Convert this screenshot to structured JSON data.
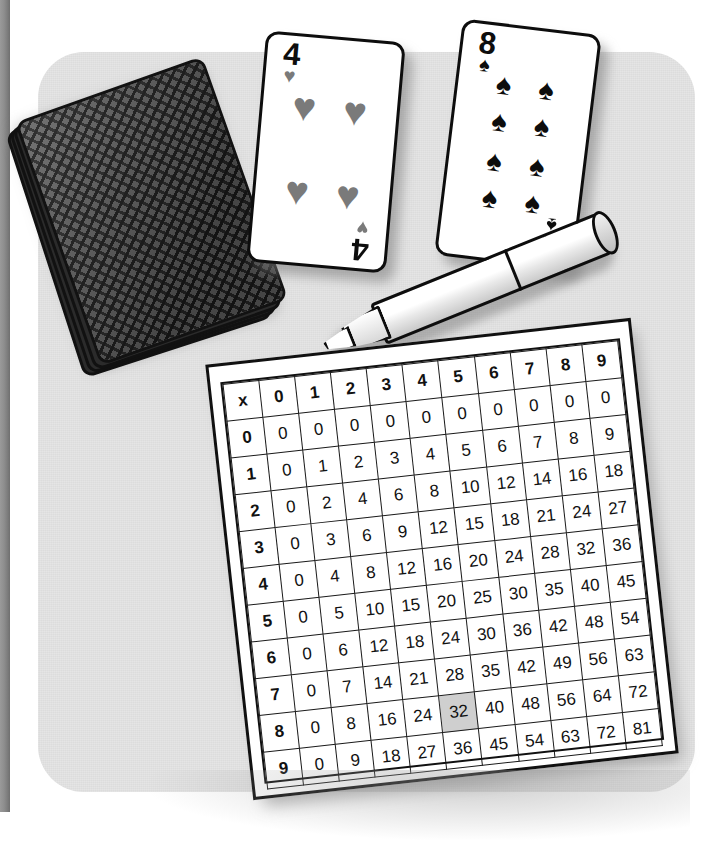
{
  "scene": {
    "title": "Multiplication table worksheet with playing cards and marker",
    "surface_color": "#dcdcdc",
    "floor_color": "#ffffff",
    "edge_bar_color": "#8e8e8e"
  },
  "deck": {
    "label": "Face-down deck of playing cards",
    "back_pattern": "diamond-chevron",
    "back_color": "#5b5b5b",
    "border_color": "#121212"
  },
  "cards": [
    {
      "name": "four-of-hearts",
      "rank": "4",
      "suit_glyph": "♥",
      "suit_name": "hearts",
      "pip_count": 4,
      "color": "#7a7a7a",
      "pips": [
        {
          "x": 31,
          "y": 31
        },
        {
          "x": 69,
          "y": 31
        },
        {
          "x": 31,
          "y": 68
        },
        {
          "x": 69,
          "y": 68
        }
      ]
    },
    {
      "name": "eight-of-spades",
      "rank": "8",
      "suit_glyph": "♠",
      "suit_name": "spades",
      "pip_count": 8,
      "color": "#0d0d0d",
      "pips": [
        {
          "x": 34,
          "y": 25
        },
        {
          "x": 66,
          "y": 25
        },
        {
          "x": 34,
          "y": 41
        },
        {
          "x": 66,
          "y": 41
        },
        {
          "x": 34,
          "y": 58
        },
        {
          "x": 66,
          "y": 58
        },
        {
          "x": 34,
          "y": 74
        },
        {
          "x": 66,
          "y": 74
        }
      ]
    }
  ],
  "marker": {
    "label": "White chisel-tip marker",
    "body_color": "#ffffff",
    "outline_color": "#0d0d0d"
  },
  "chart_data": {
    "type": "table",
    "corner_label": "x",
    "highlight": {
      "row": "8",
      "col": "4",
      "value": "32",
      "color": "#cfcfcf"
    },
    "col_headers": [
      "x",
      "0",
      "1",
      "2",
      "3",
      "4",
      "5",
      "6",
      "7",
      "8",
      "9"
    ],
    "row_headers": [
      "0",
      "1",
      "2",
      "3",
      "4",
      "5",
      "6",
      "7",
      "8",
      "9"
    ],
    "rows": [
      {
        "header": "0",
        "values": [
          "0",
          "0",
          "0",
          "0",
          "0",
          "0",
          "0",
          "0",
          "0",
          "0"
        ]
      },
      {
        "header": "1",
        "values": [
          "0",
          "1",
          "2",
          "3",
          "4",
          "5",
          "6",
          "7",
          "8",
          "9"
        ]
      },
      {
        "header": "2",
        "values": [
          "0",
          "2",
          "4",
          "6",
          "8",
          "10",
          "12",
          "14",
          "16",
          "18"
        ]
      },
      {
        "header": "3",
        "values": [
          "0",
          "3",
          "6",
          "9",
          "12",
          "15",
          "18",
          "21",
          "24",
          "27"
        ]
      },
      {
        "header": "4",
        "values": [
          "0",
          "4",
          "8",
          "12",
          "16",
          "20",
          "24",
          "28",
          "32",
          "36"
        ]
      },
      {
        "header": "5",
        "values": [
          "0",
          "5",
          "10",
          "15",
          "20",
          "25",
          "30",
          "35",
          "40",
          "45"
        ]
      },
      {
        "header": "6",
        "values": [
          "0",
          "6",
          "12",
          "18",
          "24",
          "30",
          "36",
          "42",
          "48",
          "54"
        ]
      },
      {
        "header": "7",
        "values": [
          "0",
          "7",
          "14",
          "21",
          "28",
          "35",
          "42",
          "49",
          "56",
          "63"
        ]
      },
      {
        "header": "8",
        "values": [
          "0",
          "8",
          "16",
          "24",
          "32",
          "40",
          "48",
          "56",
          "64",
          "72"
        ]
      },
      {
        "header": "9",
        "values": [
          "0",
          "9",
          "18",
          "27",
          "36",
          "45",
          "54",
          "63",
          "72",
          "81"
        ]
      }
    ]
  }
}
